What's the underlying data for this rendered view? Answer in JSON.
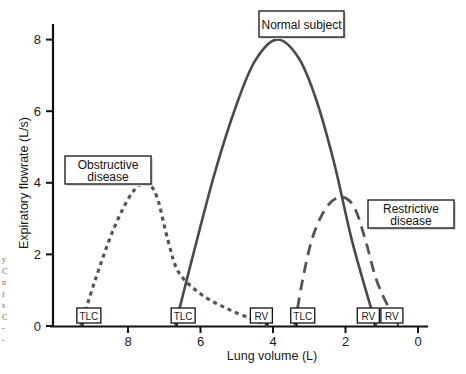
{
  "chart_data": {
    "type": "line",
    "title": "",
    "xlabel": "Lung volume (L)",
    "ylabel": "Expiratory flowrate (L/s)",
    "xlim": [
      10,
      0
    ],
    "ylim": [
      0,
      8
    ],
    "x_reversed": true,
    "grid": false,
    "x_ticks": [
      8,
      6,
      4,
      2,
      0
    ],
    "y_ticks": [
      0,
      2,
      4,
      6,
      8
    ],
    "series": [
      {
        "name": "Normal subject",
        "style": "solid",
        "color": "#4a4a4a",
        "points": [
          [
            6.7,
            0
          ],
          [
            6.2,
            2.0
          ],
          [
            5.6,
            4.3
          ],
          [
            5.0,
            6.2
          ],
          [
            4.5,
            7.4
          ],
          [
            3.9,
            8.0
          ],
          [
            3.3,
            7.5
          ],
          [
            2.8,
            6.3
          ],
          [
            2.3,
            4.5
          ],
          [
            1.8,
            2.3
          ],
          [
            1.15,
            0
          ]
        ],
        "markers": [
          {
            "label": "TLC",
            "x": 6.7
          },
          {
            "label": "RV",
            "x": 1.15
          }
        ]
      },
      {
        "name": "Obstructive disease",
        "style": "dotted",
        "color": "#555555",
        "points": [
          [
            9.3,
            0
          ],
          [
            8.9,
            1.3
          ],
          [
            8.4,
            2.7
          ],
          [
            7.9,
            3.7
          ],
          [
            7.5,
            4.0
          ],
          [
            7.2,
            3.6
          ],
          [
            6.9,
            2.4
          ],
          [
            6.6,
            1.5
          ],
          [
            6.0,
            0.9
          ],
          [
            5.3,
            0.5
          ],
          [
            4.6,
            0.2
          ],
          [
            4.1,
            0
          ]
        ],
        "markers": [
          {
            "label": "TLC",
            "x": 9.3
          },
          {
            "label": "RV",
            "x": 4.1
          }
        ]
      },
      {
        "name": "Restrictive disease",
        "style": "dashed",
        "color": "#555555",
        "points": [
          [
            3.4,
            0
          ],
          [
            3.2,
            1.2
          ],
          [
            2.9,
            2.5
          ],
          [
            2.5,
            3.35
          ],
          [
            2.1,
            3.6
          ],
          [
            1.75,
            3.3
          ],
          [
            1.45,
            2.4
          ],
          [
            1.15,
            1.3
          ],
          [
            0.8,
            0.5
          ],
          [
            0.5,
            0
          ]
        ],
        "markers": [
          {
            "label": "TLC",
            "x": 3.4
          },
          {
            "label": "RV",
            "x": 0.5
          }
        ]
      }
    ],
    "annotations": [
      {
        "text": [
          "Normal subject"
        ],
        "series": "Normal subject"
      },
      {
        "text": [
          "Obstructive",
          "disease"
        ],
        "series": "Obstructive disease"
      },
      {
        "text": [
          "Restrictive",
          "disease"
        ],
        "series": "Restrictive disease"
      }
    ]
  },
  "margin_fragments": [
    "y",
    "C",
    "n",
    "f",
    "s",
    "C",
    "-",
    "-"
  ]
}
